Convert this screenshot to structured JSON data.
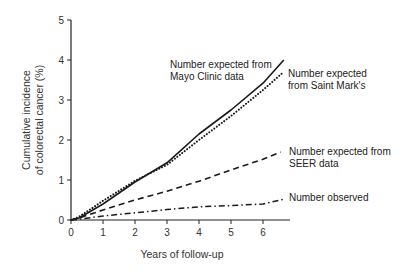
{
  "chart_data": {
    "type": "line",
    "title": "",
    "xlabel": "Years of follow-up",
    "ylabel_lines": [
      "Cumulative incidence",
      "of colorectal cancer (%)"
    ],
    "ylabel": "Cumulative incidence of colorectal cancer (%)",
    "xlim": [
      0,
      7
    ],
    "ylim": [
      0,
      5
    ],
    "x_ticks": [
      "0",
      "1",
      "2",
      "3",
      "4",
      "5",
      "6"
    ],
    "y_ticks": [
      "0",
      "1",
      "2",
      "3",
      "4",
      "5"
    ],
    "grid": false,
    "legend_position": "inline annotations at line ends",
    "series": [
      {
        "name": "Number expected from Mayo Clinic data",
        "label_lines": [
          "Number expected from",
          "Mayo Clinic data"
        ],
        "style": "solid",
        "x": [
          0,
          0.25,
          1,
          2,
          3,
          4,
          5,
          6,
          6.65
        ],
        "y": [
          0,
          0.05,
          0.4,
          0.95,
          1.43,
          2.15,
          2.75,
          3.42,
          4.0
        ]
      },
      {
        "name": "Number expected from Saint Mark's",
        "label_lines": [
          "Number expected",
          "from Saint Mark's"
        ],
        "style": "dotted",
        "x": [
          0,
          0.25,
          1,
          2,
          3,
          4,
          5,
          6,
          6.6
        ],
        "y": [
          0,
          0.08,
          0.48,
          0.98,
          1.38,
          2.0,
          2.6,
          3.25,
          3.67
        ]
      },
      {
        "name": "Number expected from SEER data",
        "label_lines": [
          "Number expected from",
          "SEER data"
        ],
        "style": "dashed",
        "x": [
          0,
          0.25,
          1,
          2,
          3,
          4,
          5,
          6,
          6.55
        ],
        "y": [
          0,
          0.05,
          0.25,
          0.5,
          0.72,
          0.97,
          1.25,
          1.52,
          1.7
        ]
      },
      {
        "name": "Number observed",
        "label_lines": [
          "Number observed"
        ],
        "style": "dash-dot",
        "x": [
          0,
          0.25,
          1,
          2,
          3,
          4,
          5,
          6,
          6.65
        ],
        "y": [
          0,
          0.02,
          0.1,
          0.18,
          0.26,
          0.33,
          0.36,
          0.4,
          0.52
        ]
      }
    ]
  }
}
